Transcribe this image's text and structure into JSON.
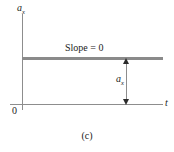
{
  "figure": {
    "caption": "(c)",
    "background_color": "#ffffff",
    "axis_color": "#8d8d8d",
    "data_line_color": "#8a8a8a",
    "arrow_color": "#2b2b2b",
    "text_color": "#1b1b1b"
  },
  "axes": {
    "y_label_base": "a",
    "y_label_sub": "x",
    "x_label": "t",
    "origin_label": "0"
  },
  "annotations": {
    "slope_text": "Slope = 0",
    "measure_label_base": "a",
    "measure_label_sub": "x"
  },
  "chart_data": {
    "type": "line",
    "title": "",
    "subtitle": "",
    "xlabel": "t",
    "ylabel": "a_x",
    "grid": false,
    "legend": "none",
    "xlim": [
      0,
      1
    ],
    "ylim": [
      0,
      1
    ],
    "series": [
      {
        "name": "a_x",
        "x": [
          0,
          1
        ],
        "values": [
          0.52,
          0.52
        ],
        "note": "constant acceleration, horizontal line"
      }
    ],
    "annotations": [
      {
        "text": "Slope = 0",
        "type": "text",
        "x": 0.45,
        "y": 0.62
      },
      {
        "text": "a_x",
        "type": "double-arrow",
        "x": 0.74,
        "y_from": 0.0,
        "y_to": 0.52,
        "note": "vertical double-headed arrow measuring constant a_x from t-axis to the line"
      }
    ]
  }
}
